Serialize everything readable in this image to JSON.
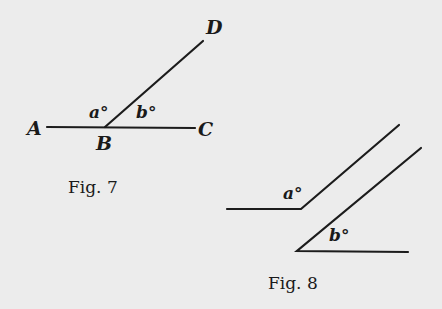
{
  "figures": [
    {
      "caption": "Fig. 7",
      "points": {
        "A": "A",
        "B": "B",
        "C": "C",
        "D": "D"
      },
      "angles": {
        "a": "a°",
        "b": "b°"
      },
      "description": "Line AC with ray BD from point B; angles a° (ABD) and b° (DBC) are supplementary"
    },
    {
      "caption": "Fig. 8",
      "angles": {
        "a": "a°",
        "b": "b°"
      },
      "description": "Two angles with parallel sides; a° formed by horizontal ray left and slanted ray up-right, b° formed by horizontal ray right and slanted ray up-right"
    }
  ],
  "colors": {
    "ink": "#1c1c1c",
    "paper": "#ececec"
  }
}
